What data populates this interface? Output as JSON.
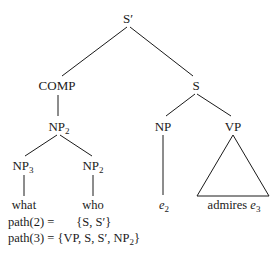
{
  "tree": {
    "root": {
      "label": "S′"
    },
    "comp": {
      "label": "COMP"
    },
    "s": {
      "label": "S"
    },
    "np2_top": {
      "label": "NP",
      "sub": "2"
    },
    "np3": {
      "label": "NP",
      "sub": "3"
    },
    "np2_right": {
      "label": "NP",
      "sub": "2"
    },
    "np": {
      "label": "NP"
    },
    "vp": {
      "label": "VP"
    },
    "leaves": {
      "what": "what",
      "who": "who",
      "e2": {
        "label": "e",
        "sub": "2"
      },
      "admires": {
        "text": "admires",
        "trace": "e",
        "sub": "3"
      }
    }
  },
  "paths": {
    "path2": {
      "lhs": "path(2) =",
      "rhs": "{S, S′}"
    },
    "path3": {
      "lhs": "path(3) =",
      "rhs_pre": "{VP, S, S′, NP",
      "rhs_sub": "2",
      "rhs_post": "}"
    }
  },
  "colors": {
    "ink": "#1a1a1a",
    "background": "#ffffff"
  }
}
